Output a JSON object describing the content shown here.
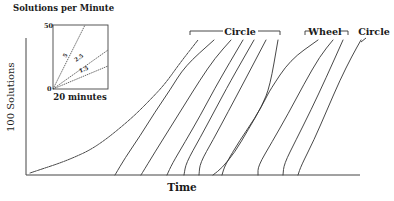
{
  "chart_data": {
    "type": "line",
    "title": "",
    "xlabel": "Time",
    "ylabel": "100 Solutions",
    "grid": false,
    "legend_position": "top-left inset",
    "inset": {
      "title": "Solutions per Minute",
      "y_top_label": "50",
      "y_bottom_label": "0",
      "xlabel": "20 minutes",
      "rate_lines": [
        {
          "label": "5",
          "rate": 5
        },
        {
          "label": "2.5",
          "rate": 2.5
        },
        {
          "label": "1.5",
          "rate": 1.5
        }
      ]
    },
    "group_labels": [
      {
        "label": "Circle",
        "curve_indices": [
          1,
          2,
          3,
          4,
          5,
          6,
          7
        ]
      },
      {
        "label": "Wheel",
        "curve_indices": [
          8,
          9
        ]
      },
      {
        "label": "Circle",
        "curve_indices": [
          10
        ]
      }
    ],
    "series": [
      {
        "name": "Circle (initial session)",
        "group": "Circle",
        "points": [
          [
            30,
            173
          ],
          [
            45,
            168
          ],
          [
            60,
            163
          ],
          [
            75,
            157
          ],
          [
            90,
            150
          ],
          [
            105,
            140
          ],
          [
            120,
            128
          ],
          [
            135,
            115
          ],
          [
            150,
            100
          ],
          [
            165,
            84
          ],
          [
            180,
            63
          ],
          [
            198,
            40
          ]
        ]
      },
      {
        "name": "Circle 1",
        "group": "Circle",
        "points": [
          [
            115,
            175
          ],
          [
            125,
            158
          ],
          [
            140,
            136
          ],
          [
            155,
            112
          ],
          [
            170,
            90
          ],
          [
            185,
            66
          ],
          [
            214,
            40
          ]
        ]
      },
      {
        "name": "Circle 2",
        "group": "Circle",
        "points": [
          [
            141,
            175
          ],
          [
            155,
            152
          ],
          [
            170,
            128
          ],
          [
            185,
            104
          ],
          [
            200,
            80
          ],
          [
            215,
            58
          ],
          [
            231,
            40
          ]
        ]
      },
      {
        "name": "Circle 3",
        "group": "Circle",
        "points": [
          [
            167,
            175
          ],
          [
            172,
            164
          ],
          [
            185,
            142
          ],
          [
            200,
            116
          ],
          [
            215,
            88
          ],
          [
            230,
            62
          ],
          [
            243,
            40
          ]
        ]
      },
      {
        "name": "Circle 4",
        "group": "Circle",
        "points": [
          [
            184,
            175
          ],
          [
            186,
            163
          ],
          [
            200,
            138
          ],
          [
            215,
            110
          ],
          [
            230,
            82
          ],
          [
            254,
            40
          ]
        ]
      },
      {
        "name": "Circle 5",
        "group": "Circle",
        "points": [
          [
            199,
            175
          ],
          [
            200,
            163
          ],
          [
            213,
            140
          ],
          [
            228,
            112
          ],
          [
            245,
            80
          ],
          [
            266,
            40
          ]
        ]
      },
      {
        "name": "Circle 6",
        "group": "Circle",
        "points": [
          [
            213,
            175
          ],
          [
            222,
            168
          ],
          [
            235,
            152
          ],
          [
            248,
            130
          ],
          [
            262,
            106
          ],
          [
            270,
            86
          ],
          [
            278,
            40
          ]
        ]
      },
      {
        "name": "Circle 7",
        "group": "Circle",
        "points": [
          [
            222,
            175
          ],
          [
            225,
            165
          ],
          [
            240,
            140
          ],
          [
            255,
            118
          ],
          [
            265,
            100
          ],
          [
            270,
            90
          ],
          [
            290,
            60
          ],
          [
            318,
            40
          ]
        ]
      },
      {
        "name": "Wheel 1",
        "group": "Wheel",
        "points": [
          [
            258,
            175
          ],
          [
            258,
            166
          ],
          [
            272,
            142
          ],
          [
            288,
            114
          ],
          [
            304,
            84
          ],
          [
            320,
            56
          ],
          [
            333,
            40
          ]
        ]
      },
      {
        "name": "Wheel 2",
        "group": "Wheel",
        "points": [
          [
            283,
            175
          ],
          [
            284,
            164
          ],
          [
            296,
            140
          ],
          [
            311,
            110
          ],
          [
            326,
            78
          ],
          [
            343,
            40
          ]
        ]
      },
      {
        "name": "Circle 8",
        "group": "Circle",
        "points": [
          [
            298,
            175
          ],
          [
            301,
            166
          ],
          [
            314,
            140
          ],
          [
            327,
            110
          ],
          [
            340,
            80
          ],
          [
            352,
            56
          ],
          [
            361,
            40
          ]
        ]
      }
    ]
  }
}
